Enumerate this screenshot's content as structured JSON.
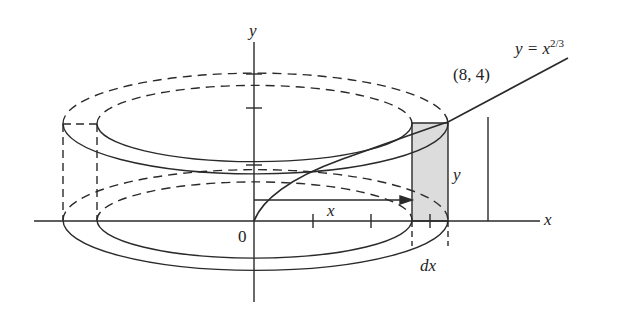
{
  "diagram": {
    "type": "shell-method-solid-of-revolution",
    "curve_label_prefix": "y = x",
    "curve_label_exponent": "2/3",
    "point_label": "(8, 4)",
    "axis_x_label": "x",
    "axis_y_label": "y",
    "origin_label": "0",
    "radius_label": "x",
    "height_label": "y",
    "thickness_label": "dx",
    "colors": {
      "line": "#2a2a2a",
      "shell_fill": "#dcdcdc",
      "background": "#ffffff"
    }
  }
}
